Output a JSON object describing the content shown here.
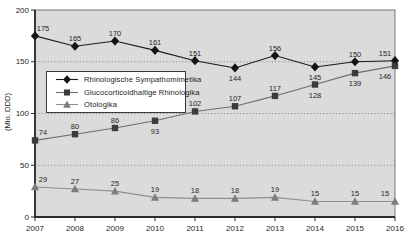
{
  "figure": {
    "background": "#ffffff",
    "plot_background": "#dbdbdb",
    "gridline_color": "#7d7d7d",
    "axis_color": "#2b2b2b",
    "border_color": "#5a5a5a",
    "label_color": "#262626"
  },
  "chart_data": {
    "type": "line",
    "title": "",
    "xlabel": "",
    "ylabel": "(Mio. DDD)",
    "x": [
      "2007",
      "2008",
      "2009",
      "2010",
      "2011",
      "2012",
      "2013",
      "2014",
      "2015",
      "2016"
    ],
    "ylim": [
      0,
      200
    ],
    "yticks": [
      "0",
      "50",
      "100",
      "150",
      "200"
    ],
    "grid": "horizontal dotted at 50, 100, 150",
    "legend_position": "upper-left inside plot",
    "series": [
      {
        "name": "Rhinologische Sympathomimetika",
        "marker": "diamond",
        "marker_color": "#141414",
        "line_color": "#1a1a1a",
        "values": [
          175,
          165,
          170,
          161,
          151,
          144,
          156,
          145,
          150,
          151
        ],
        "label_side": [
          "above",
          "above",
          "above",
          "above",
          "above",
          "below",
          "above",
          "below",
          "above",
          "above"
        ]
      },
      {
        "name": "Glucocorticoidhaltige Rhinologika",
        "marker": "square",
        "marker_color": "#3c3c3c",
        "line_color": "#6e6e6e",
        "values": [
          74,
          80,
          86,
          93,
          102,
          107,
          117,
          128,
          139,
          146
        ],
        "label_side": [
          "above",
          "above",
          "above",
          "below",
          "above",
          "above",
          "above",
          "below",
          "below",
          "below"
        ]
      },
      {
        "name": "Otologika",
        "marker": "triangle",
        "marker_color": "#7d7d7d",
        "line_color": "#8f8f8f",
        "values": [
          29,
          27,
          25,
          19,
          18,
          18,
          19,
          15,
          15,
          15
        ],
        "label_side": [
          "above",
          "above",
          "above",
          "above",
          "above",
          "above",
          "above",
          "above",
          "above",
          "above"
        ]
      }
    ]
  }
}
